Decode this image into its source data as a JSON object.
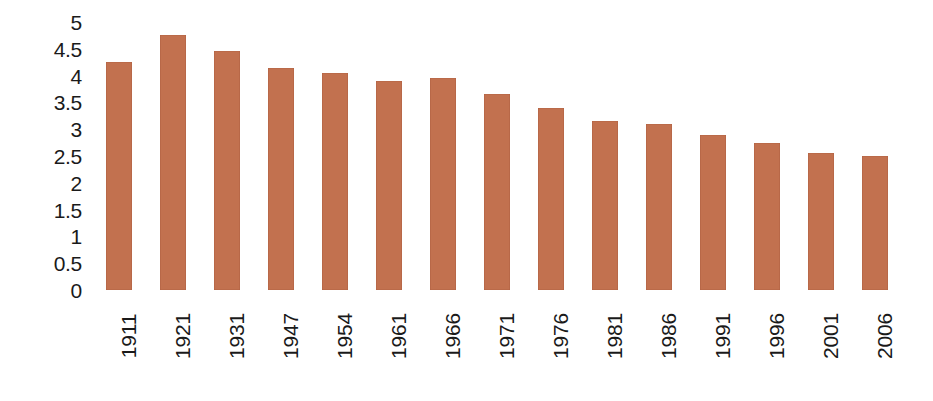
{
  "chart_data": {
    "type": "bar",
    "title": "",
    "subtitle": "",
    "xlabel": "",
    "ylabel": "",
    "categories": [
      "1911",
      "1921",
      "1931",
      "1947",
      "1954",
      "1961",
      "1966",
      "1971",
      "1976",
      "1981",
      "1986",
      "1991",
      "1996",
      "2001",
      "2006"
    ],
    "values": [
      4.25,
      4.75,
      4.45,
      4.15,
      4.05,
      3.9,
      3.95,
      3.65,
      3.4,
      3.15,
      3.1,
      2.9,
      2.75,
      2.55,
      2.5
    ],
    "ylim": [
      0,
      5
    ],
    "ytick_labels": [
      "5",
      "4.5",
      "4",
      "3.5",
      "3",
      "2.5",
      "2",
      "1.5",
      "1",
      "0.5",
      "0"
    ],
    "ytick_values": [
      5,
      4.5,
      4,
      3.5,
      3,
      2.5,
      2,
      1.5,
      1,
      0.5,
      0
    ],
    "grid": false,
    "legend": null,
    "legend_position": "none",
    "series_name": "",
    "bar_color": "#c2714f",
    "background_color": "#ffffff",
    "text_color": "#1a1a1a",
    "xtick_rotation": "90"
  }
}
